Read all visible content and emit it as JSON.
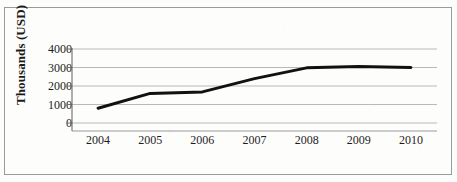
{
  "figure": {
    "title_sliver": "",
    "background_color": "#fdfdfc",
    "frame_color": "#9a9a9a",
    "line_color": "#111111",
    "grid_color": "#b9b9b9",
    "text_color": "#1d1d1d"
  },
  "chart_data": {
    "type": "line",
    "title": "",
    "xlabel": "",
    "ylabel": "Thousands (USD)",
    "categories": [
      "2004",
      "2005",
      "2006",
      "2007",
      "2008",
      "2009",
      "2010"
    ],
    "x": [
      2004,
      2005,
      2006,
      2007,
      2008,
      2009,
      2010
    ],
    "values": [
      800,
      1600,
      1680,
      2400,
      2980,
      3050,
      3000
    ],
    "series": [
      {
        "name": "Thousands (USD)",
        "values": [
          800,
          1600,
          1680,
          2400,
          2980,
          3050,
          3000
        ]
      }
    ],
    "ylim": [
      0,
      4000
    ],
    "yticks": [
      0,
      1000,
      2000,
      3000,
      4000
    ],
    "ytick_labels": [
      "0",
      "1000",
      "2000",
      "3000",
      "4000"
    ],
    "xtick_labels": [
      "2004",
      "2005",
      "2006",
      "2007",
      "2008",
      "2009",
      "2010"
    ],
    "grid": "horizontal",
    "legend": "none",
    "line_width": 3,
    "markers": "none"
  }
}
